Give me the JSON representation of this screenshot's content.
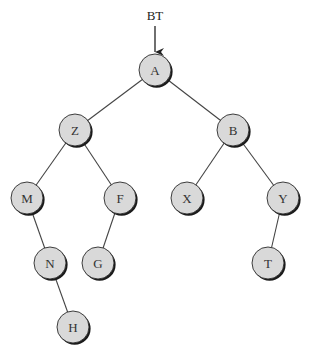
{
  "diagram": {
    "type": "binary-tree",
    "root_pointer": {
      "label": "BT",
      "x": 155,
      "y": 20,
      "arrow_from_y": 26,
      "arrow_to_y": 52
    },
    "style": {
      "node_fill": "#d9d9d9",
      "node_stroke": "#2a2a2a",
      "node_shadow": "#1a1a1a",
      "edge_color": "#444444",
      "label_color": "#333333",
      "node_radius": 16
    },
    "nodes": [
      {
        "id": "A",
        "label": "A",
        "x": 155,
        "y": 70
      },
      {
        "id": "Z",
        "label": "Z",
        "x": 75,
        "y": 130
      },
      {
        "id": "B",
        "label": "B",
        "x": 233,
        "y": 130
      },
      {
        "id": "M",
        "label": "M",
        "x": 27,
        "y": 198
      },
      {
        "id": "F",
        "label": "F",
        "x": 120,
        "y": 198
      },
      {
        "id": "X",
        "label": "X",
        "x": 187,
        "y": 198
      },
      {
        "id": "Y",
        "label": "Y",
        "x": 283,
        "y": 198
      },
      {
        "id": "N",
        "label": "N",
        "x": 50,
        "y": 263
      },
      {
        "id": "G",
        "label": "G",
        "x": 98,
        "y": 263
      },
      {
        "id": "T",
        "label": "T",
        "x": 268,
        "y": 263
      },
      {
        "id": "H",
        "label": "H",
        "x": 73,
        "y": 327
      }
    ],
    "edges": [
      {
        "from": "A",
        "to": "Z",
        "side": "left"
      },
      {
        "from": "A",
        "to": "B",
        "side": "right"
      },
      {
        "from": "Z",
        "to": "M",
        "side": "left"
      },
      {
        "from": "Z",
        "to": "F",
        "side": "right"
      },
      {
        "from": "B",
        "to": "X",
        "side": "left"
      },
      {
        "from": "B",
        "to": "Y",
        "side": "right"
      },
      {
        "from": "M",
        "to": "N",
        "side": "right"
      },
      {
        "from": "F",
        "to": "G",
        "side": "left"
      },
      {
        "from": "Y",
        "to": "T",
        "side": "left"
      },
      {
        "from": "N",
        "to": "H",
        "side": "right"
      }
    ]
  }
}
